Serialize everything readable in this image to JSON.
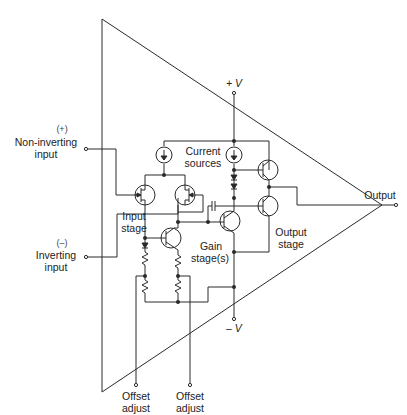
{
  "diagram": {
    "type": "operational-amplifier-internal-schematic",
    "labels": {
      "plus_sign": "(+)",
      "non_inverting": "Non-inverting",
      "non_inverting_2": "input",
      "minus_sign": "(–)",
      "inverting": "Inverting",
      "inverting_2": "input",
      "plus_v": "+ V",
      "minus_v": "– V",
      "current_sources_1": "Current",
      "current_sources_2": "sources",
      "input_stage_1": "Input",
      "input_stage_2": "stage",
      "gain_stage_1": "Gain",
      "gain_stage_2": "stage(s)",
      "output_stage_1": "Output",
      "output_stage_2": "stage",
      "output": "Output",
      "offset_adjust_left_1": "Offset",
      "offset_adjust_left_2": "adjust",
      "offset_adjust_right_1": "Offset",
      "offset_adjust_right_2": "adjust"
    },
    "blocks": [
      "Current sources",
      "Input stage",
      "Gain stage(s)",
      "Output stage"
    ],
    "terminals": [
      "Non-inverting input (+)",
      "Inverting input (–)",
      "+V",
      "–V",
      "Output",
      "Offset adjust",
      "Offset adjust"
    ],
    "colors": {
      "line": "#2a2a2a",
      "background": "#ffffff"
    }
  }
}
